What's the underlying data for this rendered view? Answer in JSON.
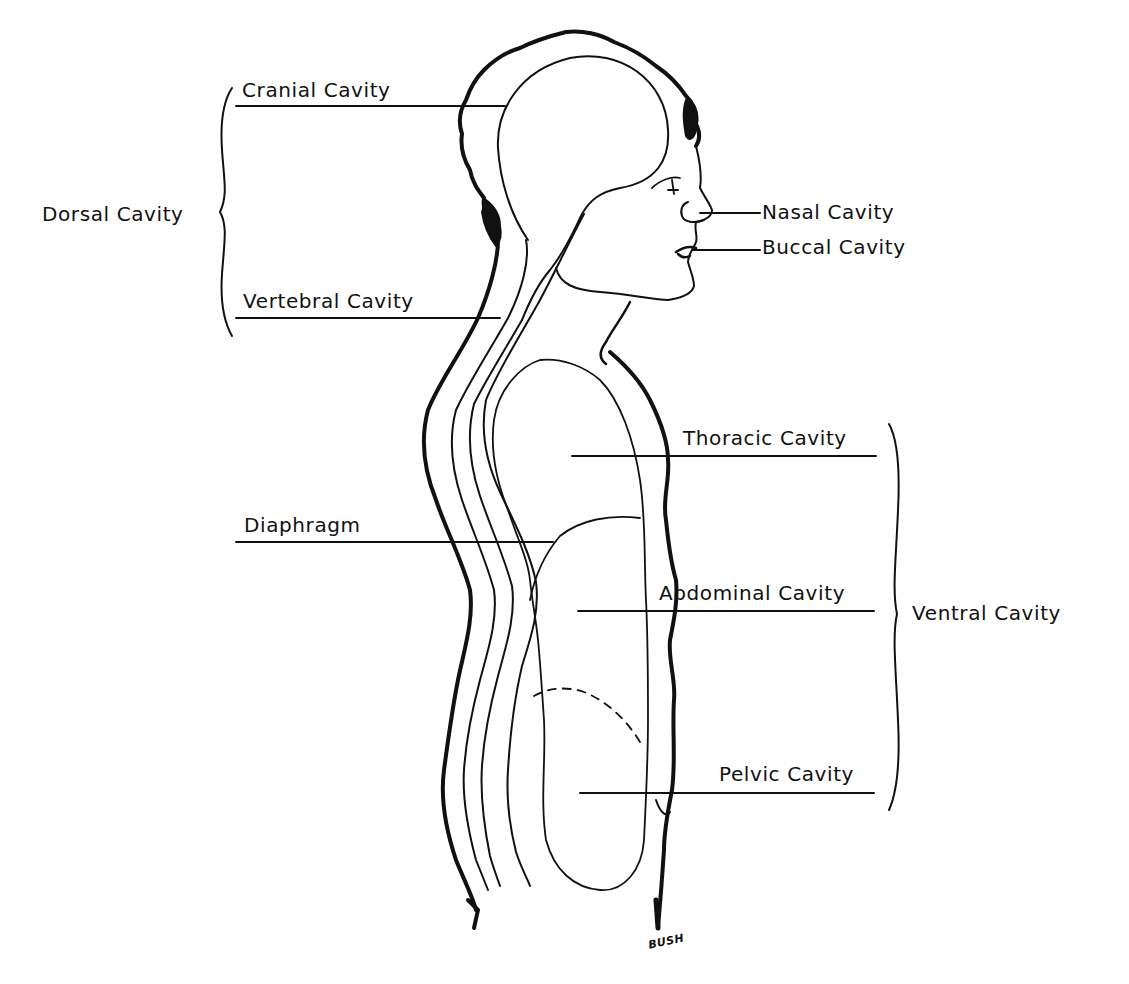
{
  "figure": {
    "type": "anatomical line drawing",
    "artist_signature": "BUSH",
    "caption_partially_visible": ""
  },
  "labels": {
    "dorsal_group": {
      "bracket_label": "Dorsal Cavity",
      "items": [
        {
          "id": "cranial",
          "label": "Cranial Cavity"
        },
        {
          "id": "vertebral",
          "label": "Vertebral Cavity"
        }
      ]
    },
    "ventral_group": {
      "bracket_label": "Ventral Cavity",
      "items": [
        {
          "id": "thoracic",
          "label": "Thoracic Cavity"
        },
        {
          "id": "abdominal",
          "label": "Abdominal Cavity"
        },
        {
          "id": "pelvic",
          "label": "Pelvic Cavity"
        }
      ]
    },
    "head": [
      {
        "id": "nasal",
        "label": "Nasal Cavity"
      },
      {
        "id": "buccal",
        "label": "Buccal Cavity"
      }
    ],
    "other": [
      {
        "id": "diaphragm",
        "label": "Diaphragm"
      }
    ]
  },
  "colors": {
    "ink": "#111111",
    "background": "#ffffff"
  }
}
